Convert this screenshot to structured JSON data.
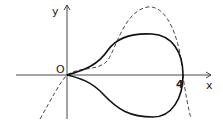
{
  "figure": {
    "axes": {
      "x_label": "x",
      "y_label": "y",
      "origin_label": "O",
      "x_tick_label": "4"
    },
    "curves": [
      {
        "name": "loop",
        "style": "solid",
        "passes_through": [
          "O",
          "4"
        ]
      },
      {
        "name": "cubic",
        "style": "dashed",
        "passes_through": [
          "O",
          "4"
        ]
      }
    ],
    "colors": {
      "stroke": "#1a1a1a",
      "background": "#ffffff"
    }
  }
}
